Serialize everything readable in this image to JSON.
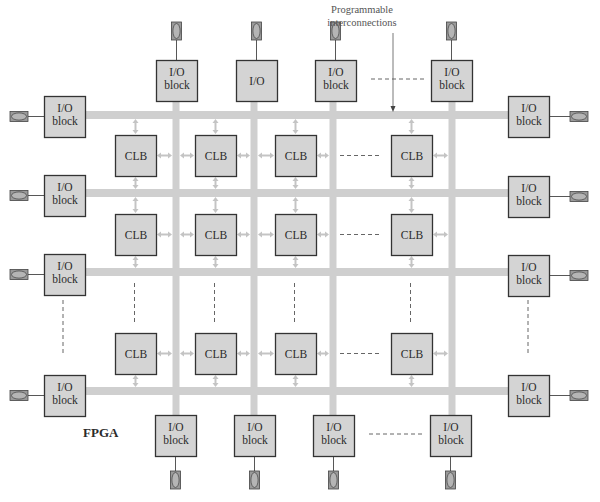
{
  "title": "FPGA",
  "annotation": "Programmable interconnections",
  "annotation_lines": [
    "Programmable",
    "interconnections"
  ],
  "colors": {
    "block_fill": "#d4d4d4",
    "block_stroke": "#333333",
    "channel": "#cfcfcf",
    "arrow": "#c4c4c4",
    "pin_fill": "#b5b5b5",
    "pin_outline": "#444444",
    "dash": "#555555"
  },
  "clb_label": "CLB",
  "io_label_lines": [
    "I/O",
    "block"
  ],
  "top_io": [
    {
      "lines": [
        "I/O",
        "block"
      ]
    },
    {
      "lines": [
        "I/O"
      ]
    },
    {
      "lines": [
        "I/O",
        "block"
      ]
    },
    {
      "lines": [
        "I/O",
        "block"
      ]
    }
  ],
  "bottom_io": [
    {
      "lines": [
        "I/O",
        "block"
      ]
    },
    {
      "lines": [
        "I/O",
        "block"
      ]
    },
    {
      "lines": [
        "I/O",
        "block"
      ]
    },
    {
      "lines": [
        "I/O",
        "block"
      ]
    }
  ],
  "left_io": [
    {
      "lines": [
        "I/O",
        "block"
      ]
    },
    {
      "lines": [
        "I/O",
        "block"
      ]
    },
    {
      "lines": [
        "I/O",
        "block"
      ]
    },
    {
      "lines": [
        "I/O",
        "block"
      ]
    }
  ],
  "right_io": [
    {
      "lines": [
        "I/O",
        "block"
      ]
    },
    {
      "lines": [
        "I/O",
        "block"
      ]
    },
    {
      "lines": [
        "I/O",
        "block"
      ]
    },
    {
      "lines": [
        "I/O",
        "block"
      ]
    }
  ],
  "clb_grid": {
    "rows": 3,
    "cols": 4,
    "elided_col_before_last": true,
    "elided_row_before_last": true
  }
}
